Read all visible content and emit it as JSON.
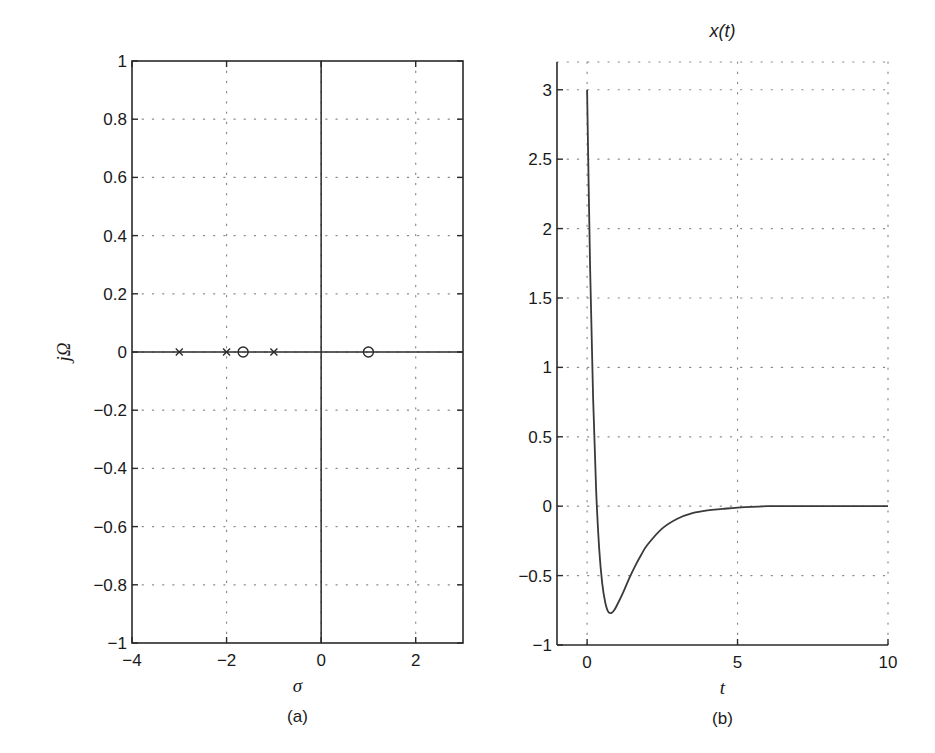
{
  "figure": {
    "panels": [
      {
        "id": "a",
        "caption": "(a)",
        "xlabel": "σ",
        "ylabel": "jΩ",
        "title": ""
      },
      {
        "id": "b",
        "caption": "(b)",
        "xlabel": "t",
        "ylabel": "",
        "title": "x(t)"
      }
    ]
  },
  "chart_data": [
    {
      "type": "scatter",
      "title": "",
      "xlabel": "σ",
      "ylabel": "jΩ",
      "caption": "(a)",
      "xlim": [
        -4,
        3
      ],
      "ylim": [
        -1,
        1
      ],
      "xticks": [
        -4,
        -2,
        0,
        2
      ],
      "xtick_labels": [
        "−4",
        "−2",
        "0",
        "2"
      ],
      "yticks": [
        -1,
        -0.8,
        -0.6,
        -0.4,
        -0.2,
        0,
        0.2,
        0.4,
        0.6,
        0.8,
        1
      ],
      "ytick_labels": [
        "−1",
        "−0.8",
        "−0.6",
        "−0.4",
        "−0.2",
        "0",
        "0.2",
        "0.4",
        "0.6",
        "0.8",
        "1"
      ],
      "grid": true,
      "series": [
        {
          "name": "poles",
          "marker": "x",
          "points": [
            [
              -3,
              0
            ],
            [
              -2,
              0
            ],
            [
              -1,
              0
            ]
          ]
        },
        {
          "name": "zeros",
          "marker": "o",
          "points": [
            [
              -1.65,
              0
            ],
            [
              1,
              0
            ]
          ]
        }
      ],
      "reference_lines": {
        "horizontal_at": 0,
        "vertical_at": 0
      }
    },
    {
      "type": "line",
      "title": "x(t)",
      "xlabel": "t",
      "ylabel": "",
      "caption": "(b)",
      "xlim": [
        -1,
        10
      ],
      "ylim": [
        -1,
        3.2
      ],
      "xticks": [
        0,
        5,
        10
      ],
      "xtick_labels": [
        "0",
        "5",
        "10"
      ],
      "yticks": [
        -1,
        -0.5,
        0,
        0.5,
        1,
        1.5,
        2,
        2.5,
        3
      ],
      "ytick_labels": [
        "−1",
        "−0.5",
        "0",
        "0.5",
        "1",
        "1.5",
        "2",
        "2.5",
        "3"
      ],
      "grid": true,
      "series": [
        {
          "name": "x(t)",
          "x": [
            0,
            0.1,
            0.2,
            0.3,
            0.4,
            0.5,
            0.6,
            0.7,
            0.8,
            0.9,
            1.0,
            1.2,
            1.4,
            1.6,
            1.8,
            2.0,
            2.5,
            3.0,
            3.5,
            4.0,
            4.5,
            5.0,
            6.0,
            7.0,
            8.0,
            9.0,
            10.0
          ],
          "values": [
            3.0,
            1.72,
            0.78,
            0.12,
            -0.3,
            -0.55,
            -0.69,
            -0.76,
            -0.77,
            -0.75,
            -0.71,
            -0.62,
            -0.52,
            -0.43,
            -0.35,
            -0.28,
            -0.16,
            -0.09,
            -0.05,
            -0.03,
            -0.02,
            -0.01,
            0.0,
            0.0,
            0.0,
            0.0,
            0.0
          ]
        }
      ]
    }
  ]
}
